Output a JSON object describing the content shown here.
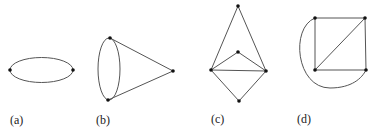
{
  "figures": [
    {
      "id": "a",
      "label": "(a)",
      "description": "Two vertices joined by two edges forming an ellipse",
      "vertices": [
        [
          10,
          70
        ],
        [
          73,
          70
        ]
      ]
    },
    {
      "id": "b",
      "label": "(b)",
      "description": "Cone shape: two vertices joined by double edge (ellipse) plus both joined to an apex",
      "vertices": [
        [
          110,
          38
        ],
        [
          108,
          100
        ],
        [
          173,
          71
        ]
      ]
    },
    {
      "id": "c",
      "label": "(c)",
      "description": "Five vertices: kite with inner triangle",
      "vertices": [
        [
          238,
          6
        ],
        [
          238,
          52
        ],
        [
          211,
          70
        ],
        [
          266,
          71
        ],
        [
          239,
          101
        ]
      ]
    },
    {
      "id": "d",
      "label": "(d)",
      "description": "Square with diagonal and outer arc",
      "vertices": [
        [
          315,
          18
        ],
        [
          365,
          18
        ],
        [
          315,
          70
        ],
        [
          366,
          70
        ]
      ]
    }
  ]
}
